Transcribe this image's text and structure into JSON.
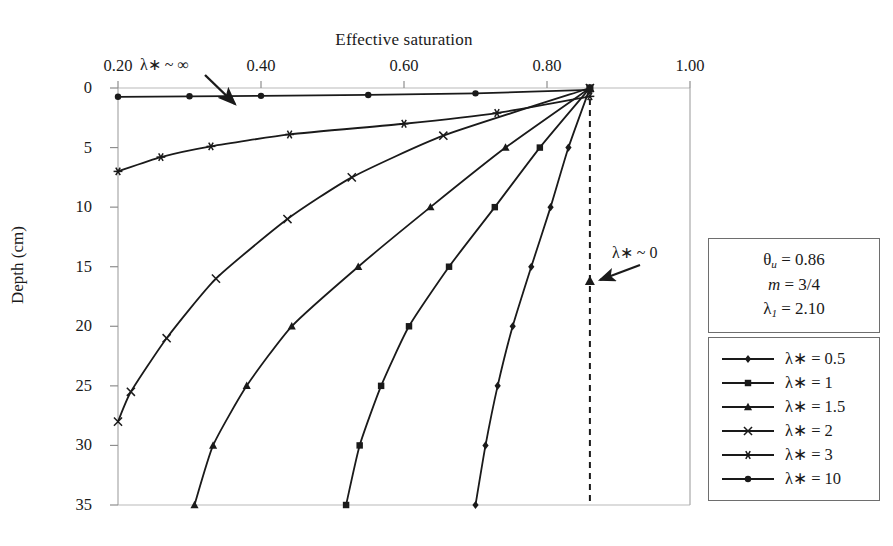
{
  "figure": {
    "title": "Effective saturation",
    "ylabel": "Depth (cm)"
  },
  "axes": {
    "x_ticks": [
      "0.20",
      "0.40",
      "0.60",
      "0.80",
      "1.00"
    ],
    "x_tick_values": [
      0.2,
      0.4,
      0.6,
      0.8,
      1.0
    ],
    "y_ticks": [
      "0",
      "5",
      "10",
      "15",
      "20",
      "25",
      "30",
      "35"
    ],
    "y_tick_values": [
      0,
      5,
      10,
      15,
      20,
      25,
      30,
      35
    ]
  },
  "annotations": [
    {
      "name": "lambda-infinity",
      "text": "λ∗ ~ ∞"
    },
    {
      "name": "lambda-zero",
      "text": "λ∗ ~ 0"
    }
  ],
  "params_box": {
    "rows": [
      {
        "symbol": "θ",
        "sub": "u",
        "value": "= 0.86"
      },
      {
        "symbol": "m",
        "sub": "",
        "value": "= 3/4"
      },
      {
        "symbol": "λ",
        "sub": "1",
        "value": "= 2.10"
      }
    ]
  },
  "legend": {
    "entries": [
      {
        "label": "λ∗ = 0.5",
        "marker": "diamond"
      },
      {
        "label": "λ∗ = 1",
        "marker": "square"
      },
      {
        "label": "λ∗ = 1.5",
        "marker": "triangle"
      },
      {
        "label": "λ∗ = 2",
        "marker": "x"
      },
      {
        "label": "λ∗ = 3",
        "marker": "asterisk"
      },
      {
        "label": "λ∗ = 10",
        "marker": "circle"
      }
    ]
  },
  "chart_data": {
    "type": "line",
    "title": "Effective saturation",
    "xlabel": "Effective saturation",
    "ylabel": "Depth (cm)",
    "xlim": [
      0.2,
      1.0
    ],
    "ylim": [
      0,
      35
    ],
    "y_inverted": true,
    "grid": false,
    "legend_position": "right",
    "reference_line": {
      "name": "theta-u-dashed-line",
      "orientation": "vertical",
      "x": 0.86,
      "style": "dashed"
    },
    "series": [
      {
        "name": "λ∗ = 0.5",
        "marker": "diamond",
        "points": [
          [
            0.86,
            0.0
          ],
          [
            0.83,
            5.0
          ],
          [
            0.805,
            10.0
          ],
          [
            0.778,
            15.0
          ],
          [
            0.752,
            20.0
          ],
          [
            0.731,
            25.0
          ],
          [
            0.714,
            30.0
          ],
          [
            0.7,
            35.0
          ]
        ]
      },
      {
        "name": "λ∗ = 1",
        "marker": "square",
        "points": [
          [
            0.86,
            0.0
          ],
          [
            0.79,
            5.0
          ],
          [
            0.727,
            10.0
          ],
          [
            0.663,
            15.0
          ],
          [
            0.607,
            20.0
          ],
          [
            0.568,
            25.0
          ],
          [
            0.538,
            30.0
          ],
          [
            0.519,
            35.0
          ]
        ]
      },
      {
        "name": "λ∗ = 1.5",
        "marker": "triangle",
        "points": [
          [
            0.86,
            0.0
          ],
          [
            0.742,
            5.0
          ],
          [
            0.637,
            10.0
          ],
          [
            0.536,
            15.0
          ],
          [
            0.443,
            20.0
          ],
          [
            0.38,
            25.0
          ],
          [
            0.333,
            30.0
          ],
          [
            0.307,
            35.0
          ]
        ]
      },
      {
        "name": "λ∗ = 2",
        "marker": "x",
        "points": [
          [
            0.86,
            0.0
          ],
          [
            0.655,
            4.0
          ],
          [
            0.527,
            7.5
          ],
          [
            0.437,
            11.0
          ],
          [
            0.337,
            16.0
          ],
          [
            0.268,
            21.0
          ],
          [
            0.218,
            25.5
          ],
          [
            0.2,
            28.0
          ]
        ]
      },
      {
        "name": "λ∗ = 3",
        "marker": "asterisk",
        "points": [
          [
            0.86,
            0.7
          ],
          [
            0.73,
            2.1
          ],
          [
            0.6,
            3.0
          ],
          [
            0.44,
            3.9
          ],
          [
            0.33,
            4.9
          ],
          [
            0.26,
            5.8
          ],
          [
            0.2,
            7.0
          ]
        ]
      },
      {
        "name": "λ∗ = 10",
        "marker": "circle",
        "points": [
          [
            0.86,
            0.15
          ],
          [
            0.7,
            0.45
          ],
          [
            0.55,
            0.58
          ],
          [
            0.4,
            0.66
          ],
          [
            0.3,
            0.7
          ],
          [
            0.2,
            0.74
          ]
        ]
      }
    ]
  }
}
